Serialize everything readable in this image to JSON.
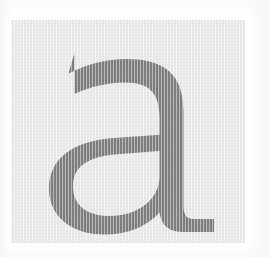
{
  "page": {
    "background_color": "#ffffff",
    "width": 269,
    "height": 257,
    "kind": "type-specimen"
  },
  "panel": {
    "name": "glyph-panel",
    "background_color": "#e9e9e9",
    "left": 11,
    "top": 20,
    "width": 234,
    "height": 223,
    "texture": "paper-scan-weave"
  },
  "glyph": {
    "character": "a",
    "case": "lowercase",
    "style": "double-storey",
    "fill_color": "#7e7e7e",
    "counter_color": "#e9e9e9",
    "description": "Large lowercase letter a with angled top-left terminal, tall right stem and bottom-right tail spur",
    "bounds": {
      "left": 63,
      "top": 40,
      "right": 215,
      "bottom": 232
    }
  },
  "colors": {
    "paper": "#ffffff",
    "panel": "#e9e9e9",
    "ink": "#7e7e7e",
    "ink_edge": "#8a8a8a"
  }
}
